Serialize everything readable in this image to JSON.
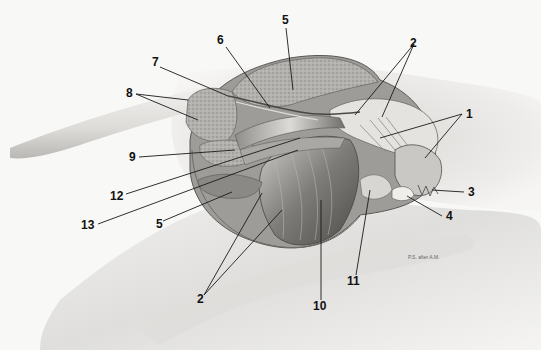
{
  "figure": {
    "type": "anatomical-illustration",
    "signature": "P.S. after A.M."
  },
  "labels": [
    {
      "id": "1",
      "text": "1",
      "x": 466,
      "y": 118,
      "lines": [
        [
          462,
          114,
          380,
          138
        ],
        [
          462,
          114,
          425,
          158
        ]
      ]
    },
    {
      "id": "2a",
      "text": "2",
      "x": 410,
      "y": 47,
      "lines": [
        [
          414,
          44,
          355,
          115
        ],
        [
          414,
          44,
          382,
          117
        ]
      ]
    },
    {
      "id": "2b",
      "text": "2",
      "x": 197,
      "y": 303,
      "lines": [
        [
          204,
          295,
          262,
          193
        ],
        [
          204,
          295,
          282,
          210
        ]
      ]
    },
    {
      "id": "3",
      "text": "3",
      "x": 468,
      "y": 196,
      "lines": [
        [
          464,
          192,
          432,
          190
        ]
      ]
    },
    {
      "id": "4",
      "text": "4",
      "x": 446,
      "y": 220,
      "lines": [
        [
          442,
          216,
          407,
          196
        ]
      ]
    },
    {
      "id": "5a",
      "text": "5",
      "x": 282,
      "y": 24,
      "lines": [
        [
          286,
          28,
          293,
          90
        ]
      ]
    },
    {
      "id": "5b",
      "text": "5",
      "x": 156,
      "y": 228,
      "lines": [
        [
          163,
          221,
          232,
          192
        ]
      ]
    },
    {
      "id": "6",
      "text": "6",
      "x": 217,
      "y": 44,
      "lines": [
        [
          226,
          47,
          270,
          108
        ]
      ]
    },
    {
      "id": "7",
      "text": "7",
      "x": 152,
      "y": 66,
      "lines": [
        [
          160,
          67,
          228,
          96
        ]
      ]
    },
    {
      "id": "8",
      "text": "8",
      "x": 126,
      "y": 97,
      "lines": [
        [
          136,
          94,
          188,
          100
        ],
        [
          136,
          94,
          198,
          120
        ]
      ]
    },
    {
      "id": "9",
      "text": "9",
      "x": 129,
      "y": 161,
      "lines": [
        [
          139,
          157,
          235,
          150
        ]
      ]
    },
    {
      "id": "12",
      "text": "12",
      "x": 110,
      "y": 200,
      "lines": [
        [
          126,
          194,
          300,
          138
        ]
      ]
    },
    {
      "id": "13",
      "text": "13",
      "x": 81,
      "y": 229,
      "lines": [
        [
          98,
          224,
          298,
          150
        ]
      ]
    },
    {
      "id": "10",
      "text": "10",
      "x": 313,
      "y": 310,
      "lines": [
        [
          321,
          300,
          321,
          200
        ]
      ]
    },
    {
      "id": "11",
      "text": "11",
      "x": 347,
      "y": 285,
      "lines": [
        [
          356,
          275,
          370,
          190
        ]
      ]
    }
  ],
  "colors": {
    "background": "#f8f8f7",
    "skin_light": "#e9e8e6",
    "skin_shade": "#bdbcb9",
    "muscle_dark": "#6e6d6a",
    "muscle_mid": "#9b9a97",
    "fat_texture": "#a8a6a2",
    "ink": "#111111"
  }
}
